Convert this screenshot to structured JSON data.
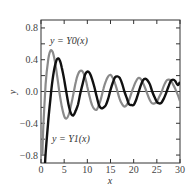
{
  "chart_data": {
    "type": "line",
    "title": "",
    "xlabel": "x",
    "ylabel": "y",
    "xlim": [
      0,
      30
    ],
    "ylim": [
      -0.9,
      0.9
    ],
    "xticks": [
      "0",
      "5",
      "10",
      "15",
      "20",
      "25",
      "30"
    ],
    "yticks": [
      "0.8",
      "0.4",
      "0.0",
      "−0.4",
      "−0.8"
    ],
    "grid": false,
    "legend": "inline annotations",
    "annotations": [
      "y = Y0(x)",
      "y = Y1(x)"
    ],
    "series": [
      {
        "name": "y = Y0(x)",
        "color": "#8a8a8a",
        "x": [
          0.3,
          0.5,
          1,
          1.5,
          2,
          2.5,
          3,
          3.5,
          4,
          4.5,
          5,
          5.5,
          6,
          6.5,
          7,
          7.5,
          8,
          8.5,
          9,
          9.5,
          10,
          10.5,
          11,
          11.5,
          12,
          12.5,
          13,
          13.5,
          14,
          14.5,
          15,
          15.5,
          16,
          16.5,
          17,
          17.5,
          18,
          18.5,
          19,
          19.5,
          20,
          20.5,
          21,
          21.5,
          22,
          22.5,
          23,
          23.5,
          24,
          24.5,
          25,
          25.5,
          26,
          26.5,
          27,
          27.5,
          28,
          28.5,
          29,
          29.5,
          30
        ],
        "values": [
          -0.81,
          -0.44,
          0.09,
          0.38,
          0.51,
          0.5,
          0.38,
          0.19,
          -0.02,
          -0.19,
          -0.31,
          -0.34,
          -0.29,
          -0.17,
          -0.03,
          0.12,
          0.22,
          0.26,
          0.25,
          0.18,
          0.06,
          -0.07,
          -0.17,
          -0.22,
          -0.23,
          -0.17,
          -0.08,
          0.04,
          0.13,
          0.19,
          0.21,
          0.17,
          0.1,
          0.0,
          -0.1,
          -0.16,
          -0.19,
          -0.17,
          -0.11,
          -0.02,
          0.06,
          0.13,
          0.17,
          0.16,
          0.11,
          0.04,
          -0.04,
          -0.11,
          -0.15,
          -0.15,
          -0.13,
          -0.07,
          -0.01,
          0.07,
          0.13,
          0.15,
          0.14,
          0.09,
          0.03,
          -0.04,
          -0.12
        ]
      },
      {
        "name": "y = Y1(x)",
        "color": "#111111",
        "x": [
          0.7,
          1,
          1.5,
          2,
          2.5,
          3,
          3.5,
          4,
          4.5,
          5,
          5.5,
          6,
          6.5,
          7,
          7.5,
          8,
          8.5,
          9,
          9.5,
          10,
          10.5,
          11,
          11.5,
          12,
          12.5,
          13,
          13.5,
          14,
          14.5,
          15,
          15.5,
          16,
          16.5,
          17,
          17.5,
          18,
          18.5,
          19,
          19.5,
          20,
          20.5,
          21,
          21.5,
          22,
          22.5,
          23,
          23.5,
          24,
          24.5,
          25,
          25.5,
          26,
          26.5,
          27,
          27.5,
          28,
          28.5,
          29,
          29.5,
          30
        ],
        "values": [
          -1.1,
          -0.78,
          -0.41,
          -0.11,
          0.15,
          0.32,
          0.41,
          0.4,
          0.3,
          0.15,
          -0.02,
          -0.18,
          -0.28,
          -0.3,
          -0.24,
          -0.16,
          -0.02,
          0.1,
          0.21,
          0.25,
          0.23,
          0.16,
          0.06,
          -0.06,
          -0.17,
          -0.21,
          -0.2,
          -0.17,
          -0.09,
          0.02,
          0.11,
          0.18,
          0.19,
          0.17,
          0.1,
          0.0,
          -0.08,
          -0.16,
          -0.17,
          -0.17,
          -0.11,
          -0.02,
          0.07,
          0.14,
          0.16,
          0.14,
          0.09,
          0.0,
          -0.07,
          -0.13,
          -0.15,
          -0.14,
          -0.09,
          -0.02,
          0.06,
          0.13,
          0.15,
          0.13,
          0.08,
          0.12
        ]
      }
    ]
  }
}
